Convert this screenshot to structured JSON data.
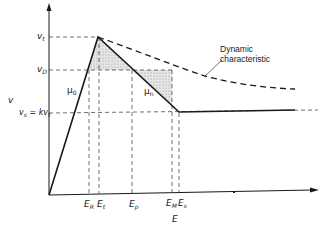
{
  "diagram": {
    "axes": {
      "x_label": "E",
      "y_label": "v"
    },
    "y_ticks": [
      {
        "id": "vt",
        "main": "v",
        "sub": "t"
      },
      {
        "id": "vD",
        "main": "v",
        "sub": "D"
      },
      {
        "id": "vs",
        "main": "v",
        "sub": "s",
        "suffix": " = kv",
        "suffix_sub": "t"
      }
    ],
    "x_ticks": [
      {
        "id": "ER",
        "main": "E",
        "sub": "R"
      },
      {
        "id": "Et",
        "main": "E",
        "sub": "t"
      },
      {
        "id": "Ep",
        "main": "E",
        "sub": "p"
      },
      {
        "id": "EM",
        "main": "E",
        "sub": "M"
      },
      {
        "id": "Es",
        "main": "E",
        "sub": "s"
      }
    ],
    "slope_labels": {
      "mu0": {
        "main": "μ",
        "sub": "0"
      },
      "mun": {
        "main": "μ",
        "sub": "n"
      }
    },
    "annotation": {
      "line1": "Dynamic",
      "line2": "characteristic"
    },
    "colors": {
      "line": "#1a1a1a",
      "dashed": "#2a2a2a",
      "hatch": "#bdbdbd"
    }
  }
}
